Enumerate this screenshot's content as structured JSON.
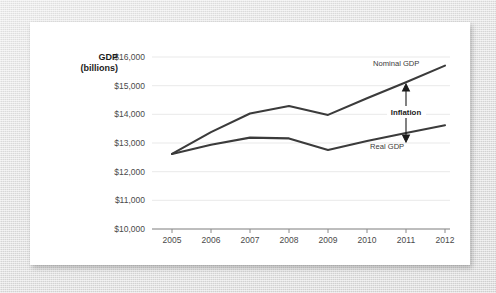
{
  "chart_data": {
    "type": "line",
    "title": "",
    "ylabel": "GDP",
    "ylabel_sub": "(billions)",
    "xlabel": "",
    "categories": [
      "2005",
      "2006",
      "2007",
      "2008",
      "2009",
      "2010",
      "2011",
      "2012"
    ],
    "x": [
      2005,
      2006,
      2007,
      2008,
      2009,
      2010,
      2011,
      2012
    ],
    "ylim": [
      10000,
      16000
    ],
    "yticks": [
      10000,
      11000,
      12000,
      13000,
      14000,
      15000,
      16000
    ],
    "ytick_labels": [
      "$10,000",
      "$11,000",
      "$12,000",
      "$13,000",
      "$14,000",
      "$15,000",
      "$16,000"
    ],
    "grid": true,
    "legend_position": "inline-annotations",
    "series": [
      {
        "name": "Nominal GDP",
        "values": [
          12620,
          13380,
          14030,
          14290,
          13980,
          14560,
          15120,
          15700
        ],
        "color": "#3b3b3b"
      },
      {
        "name": "Real GDP",
        "values": [
          12620,
          12940,
          13190,
          13160,
          12760,
          13070,
          13350,
          13620
        ],
        "color": "#3b3b3b"
      }
    ],
    "annotations": [
      {
        "id": "nominal-gdp-label",
        "text": "Nominal GDP"
      },
      {
        "id": "real-gdp-label",
        "text": "Real GDP"
      },
      {
        "id": "inflation-label",
        "text": "Inflation",
        "arrow": "double-headed-vertical",
        "at_year": 2011
      }
    ]
  }
}
